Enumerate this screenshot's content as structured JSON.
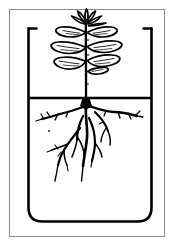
{
  "figure": {
    "title": "Plant growing in a beaker of water",
    "caption": "",
    "background_color": "#ffffff",
    "ink_color": "#000000",
    "frame_color": "#8c8c8c"
  },
  "frame": {
    "label": "figure-border",
    "x": 9,
    "y": 9,
    "width": 156,
    "height": 228,
    "stroke": "#8c8c8c",
    "stroke_width": 1
  },
  "beaker": {
    "label": "beaker",
    "left_wall_x": 28,
    "right_wall_x": 152,
    "rim_y": 28,
    "base_y": 222,
    "corner_radius": 14,
    "rim_lip_length": 8,
    "stroke": "#000000",
    "stroke_width": 2.6
  },
  "water": {
    "label": "water-surface-line",
    "level_y": 98,
    "left_x": 28,
    "right_x": 152,
    "stroke": "#000000",
    "stroke_width": 2.4
  },
  "plant": {
    "label": "seedling",
    "stem": {
      "label": "main-stem",
      "top_y": 14,
      "bottom_y": 98,
      "x": 86,
      "stroke_width": 2.2
    },
    "shoot_apex": {
      "label": "apical-leaf-cluster",
      "center_x": 86,
      "center_y": 17,
      "leaflet_count": 6
    },
    "leaf_pairs": [
      {
        "index": 1,
        "node_y": 33,
        "left_tip_x": 56,
        "right_tip_x": 120,
        "length": 31,
        "width": 11
      },
      {
        "index": 2,
        "node_y": 48,
        "left_tip_x": 52,
        "right_tip_x": 124,
        "length": 35,
        "width": 12
      },
      {
        "index": 3,
        "node_y": 62,
        "left_tip_x": 54,
        "right_tip_x": 120,
        "length": 33,
        "width": 12
      }
    ],
    "roots": {
      "label": "root-system",
      "crown_y": 100,
      "crown_x": 86,
      "lateral_roots": [
        {
          "side": "left",
          "start_y": 104,
          "end_x": 42,
          "end_y": 120
        },
        {
          "side": "right",
          "start_y": 104,
          "end_x": 138,
          "end_y": 118
        }
      ],
      "taproot_tip_y": 178,
      "branch_count": 9,
      "deepest_y": 182
    }
  },
  "annotations": {
    "visible_text": [],
    "note": "Line drawing; no labels or text present in the image"
  }
}
